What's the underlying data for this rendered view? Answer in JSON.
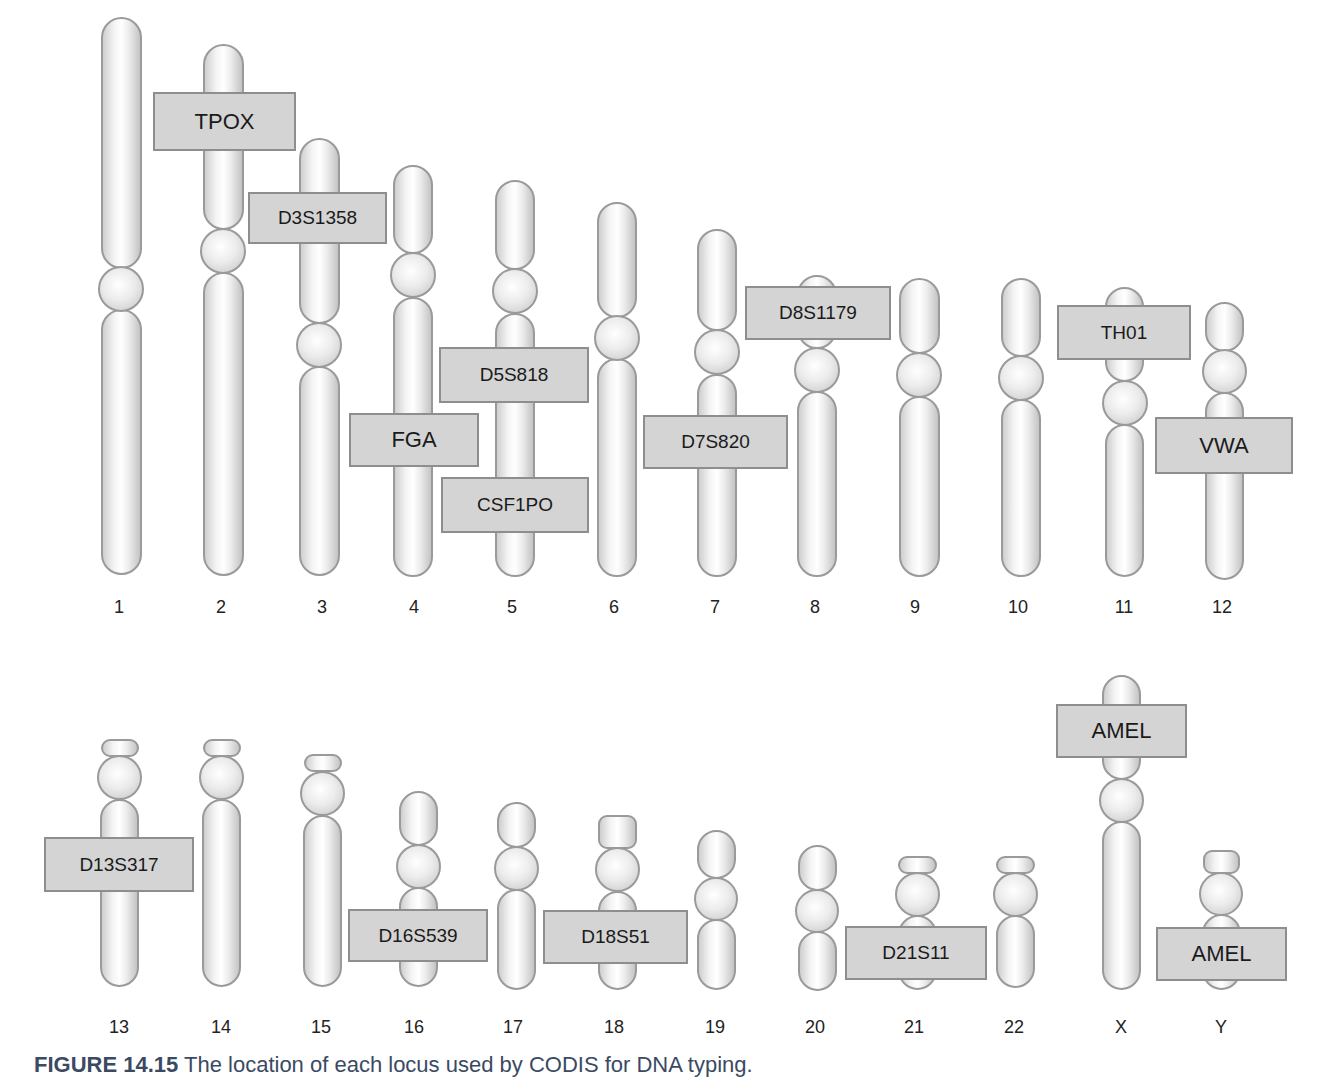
{
  "figure": {
    "caption_label": "FIGURE 14.15",
    "caption_text": "The location of each locus used by CODIS for DNA typing."
  },
  "chromosomes": [
    {
      "name": "1",
      "label_x": 119,
      "segments": [
        {
          "t": "arm",
          "x": 101,
          "y": 17,
          "w": 41,
          "h": 252
        },
        {
          "t": "circ",
          "x": 98,
          "y": 266,
          "w": 46,
          "h": 46
        },
        {
          "t": "arm",
          "x": 101,
          "y": 309,
          "w": 41,
          "h": 266
        }
      ]
    },
    {
      "name": "2",
      "label_x": 221,
      "segments": [
        {
          "t": "arm",
          "x": 203,
          "y": 44,
          "w": 41,
          "h": 186
        },
        {
          "t": "circ",
          "x": 200,
          "y": 228,
          "w": 46,
          "h": 46
        },
        {
          "t": "arm",
          "x": 203,
          "y": 272,
          "w": 41,
          "h": 304
        }
      ]
    },
    {
      "name": "3",
      "label_x": 322,
      "segments": [
        {
          "t": "arm",
          "x": 299,
          "y": 138,
          "w": 41,
          "h": 186
        },
        {
          "t": "circ",
          "x": 296,
          "y": 322,
          "w": 46,
          "h": 46
        },
        {
          "t": "arm",
          "x": 299,
          "y": 366,
          "w": 41,
          "h": 210
        }
      ]
    },
    {
      "name": "4",
      "label_x": 414,
      "segments": [
        {
          "t": "arm",
          "x": 393,
          "y": 165,
          "w": 40,
          "h": 89
        },
        {
          "t": "circ",
          "x": 390,
          "y": 252,
          "w": 46,
          "h": 46
        },
        {
          "t": "arm",
          "x": 393,
          "y": 297,
          "w": 40,
          "h": 280
        }
      ]
    },
    {
      "name": "5",
      "label_x": 512,
      "segments": [
        {
          "t": "arm",
          "x": 495,
          "y": 180,
          "w": 40,
          "h": 90
        },
        {
          "t": "circ",
          "x": 492,
          "y": 268,
          "w": 46,
          "h": 46
        },
        {
          "t": "arm",
          "x": 495,
          "y": 313,
          "w": 40,
          "h": 264
        }
      ]
    },
    {
      "name": "6",
      "label_x": 614,
      "segments": [
        {
          "t": "arm",
          "x": 597,
          "y": 202,
          "w": 40,
          "h": 116
        },
        {
          "t": "circ",
          "x": 594,
          "y": 315,
          "w": 46,
          "h": 46
        },
        {
          "t": "arm",
          "x": 597,
          "y": 358,
          "w": 40,
          "h": 219
        }
      ]
    },
    {
      "name": "7",
      "label_x": 715,
      "segments": [
        {
          "t": "arm",
          "x": 697,
          "y": 229,
          "w": 40,
          "h": 102
        },
        {
          "t": "circ",
          "x": 694,
          "y": 329,
          "w": 46,
          "h": 46
        },
        {
          "t": "arm",
          "x": 697,
          "y": 374,
          "w": 40,
          "h": 203
        }
      ]
    },
    {
      "name": "8",
      "label_x": 815,
      "segments": [
        {
          "t": "arm",
          "x": 797,
          "y": 275,
          "w": 40,
          "h": 74
        },
        {
          "t": "circ",
          "x": 794,
          "y": 347,
          "w": 46,
          "h": 46
        },
        {
          "t": "arm",
          "x": 797,
          "y": 391,
          "w": 40,
          "h": 186
        }
      ]
    },
    {
      "name": "9",
      "label_x": 915,
      "segments": [
        {
          "t": "arm",
          "x": 899,
          "y": 278,
          "w": 41,
          "h": 76
        },
        {
          "t": "circ",
          "x": 896,
          "y": 352,
          "w": 46,
          "h": 46
        },
        {
          "t": "arm",
          "x": 899,
          "y": 396,
          "w": 41,
          "h": 181
        }
      ]
    },
    {
      "name": "10",
      "label_x": 1018,
      "segments": [
        {
          "t": "arm",
          "x": 1001,
          "y": 278,
          "w": 40,
          "h": 79
        },
        {
          "t": "circ",
          "x": 998,
          "y": 355,
          "w": 46,
          "h": 46
        },
        {
          "t": "arm",
          "x": 1001,
          "y": 399,
          "w": 40,
          "h": 178
        }
      ]
    },
    {
      "name": "11",
      "label_x": 1124,
      "segments": [
        {
          "t": "arm",
          "x": 1105,
          "y": 287,
          "w": 39,
          "h": 95
        },
        {
          "t": "circ",
          "x": 1102,
          "y": 380,
          "w": 46,
          "h": 46
        },
        {
          "t": "arm",
          "x": 1105,
          "y": 424,
          "w": 39,
          "h": 153
        }
      ]
    },
    {
      "name": "12",
      "label_x": 1222,
      "segments": [
        {
          "t": "arm",
          "x": 1205,
          "y": 302,
          "w": 39,
          "h": 50
        },
        {
          "t": "circ",
          "x": 1202,
          "y": 349,
          "w": 45,
          "h": 45
        },
        {
          "t": "arm",
          "x": 1205,
          "y": 392,
          "w": 39,
          "h": 188
        }
      ]
    },
    {
      "name": "13",
      "label_x": 119,
      "segments": [
        {
          "t": "cap",
          "x": 101,
          "y": 739,
          "w": 38,
          "h": 18
        },
        {
          "t": "circ",
          "x": 97,
          "y": 755,
          "w": 45,
          "h": 45
        },
        {
          "t": "arm",
          "x": 100,
          "y": 799,
          "w": 39,
          "h": 188
        }
      ]
    },
    {
      "name": "14",
      "label_x": 221,
      "segments": [
        {
          "t": "cap",
          "x": 203,
          "y": 739,
          "w": 38,
          "h": 18
        },
        {
          "t": "circ",
          "x": 199,
          "y": 755,
          "w": 45,
          "h": 45
        },
        {
          "t": "arm",
          "x": 202,
          "y": 799,
          "w": 39,
          "h": 188
        }
      ]
    },
    {
      "name": "15",
      "label_x": 321,
      "segments": [
        {
          "t": "cap",
          "x": 304,
          "y": 754,
          "w": 38,
          "h": 18
        },
        {
          "t": "circ",
          "x": 300,
          "y": 771,
          "w": 45,
          "h": 45
        },
        {
          "t": "arm",
          "x": 303,
          "y": 815,
          "w": 39,
          "h": 172
        }
      ]
    },
    {
      "name": "16",
      "label_x": 414,
      "segments": [
        {
          "t": "arm",
          "x": 399,
          "y": 791,
          "w": 39,
          "h": 55
        },
        {
          "t": "circ",
          "x": 396,
          "y": 844,
          "w": 45,
          "h": 45
        },
        {
          "t": "arm",
          "x": 399,
          "y": 887,
          "w": 39,
          "h": 100
        }
      ]
    },
    {
      "name": "17",
      "label_x": 513,
      "segments": [
        {
          "t": "arm",
          "x": 497,
          "y": 802,
          "w": 39,
          "h": 46
        },
        {
          "t": "circ",
          "x": 494,
          "y": 846,
          "w": 45,
          "h": 45
        },
        {
          "t": "arm",
          "x": 497,
          "y": 889,
          "w": 39,
          "h": 101
        }
      ]
    },
    {
      "name": "18",
      "label_x": 614,
      "segments": [
        {
          "t": "cap",
          "x": 598,
          "y": 815,
          "w": 39,
          "h": 34
        },
        {
          "t": "circ",
          "x": 595,
          "y": 847,
          "w": 45,
          "h": 45
        },
        {
          "t": "arm",
          "x": 598,
          "y": 891,
          "w": 39,
          "h": 99
        }
      ]
    },
    {
      "name": "19",
      "label_x": 715,
      "segments": [
        {
          "t": "arm",
          "x": 697,
          "y": 830,
          "w": 39,
          "h": 49
        },
        {
          "t": "circ",
          "x": 694,
          "y": 877,
          "w": 44,
          "h": 44
        },
        {
          "t": "arm",
          "x": 697,
          "y": 919,
          "w": 39,
          "h": 71
        }
      ]
    },
    {
      "name": "20",
      "label_x": 815,
      "segments": [
        {
          "t": "arm",
          "x": 798,
          "y": 845,
          "w": 39,
          "h": 46
        },
        {
          "t": "circ",
          "x": 795,
          "y": 889,
          "w": 44,
          "h": 44
        },
        {
          "t": "arm",
          "x": 798,
          "y": 931,
          "w": 39,
          "h": 60
        }
      ]
    },
    {
      "name": "21",
      "label_x": 914,
      "segments": [
        {
          "t": "cap",
          "x": 898,
          "y": 856,
          "w": 39,
          "h": 18
        },
        {
          "t": "circ",
          "x": 895,
          "y": 872,
          "w": 45,
          "h": 45
        },
        {
          "t": "arm",
          "x": 898,
          "y": 915,
          "w": 39,
          "h": 75
        }
      ]
    },
    {
      "name": "22",
      "label_x": 1014,
      "segments": [
        {
          "t": "cap",
          "x": 996,
          "y": 856,
          "w": 39,
          "h": 18
        },
        {
          "t": "circ",
          "x": 993,
          "y": 872,
          "w": 45,
          "h": 45
        },
        {
          "t": "arm",
          "x": 996,
          "y": 915,
          "w": 39,
          "h": 73
        }
      ]
    },
    {
      "name": "X",
      "label_x": 1121,
      "segments": [
        {
          "t": "arm",
          "x": 1102,
          "y": 675,
          "w": 39,
          "h": 105
        },
        {
          "t": "circ",
          "x": 1099,
          "y": 778,
          "w": 45,
          "h": 45
        },
        {
          "t": "arm",
          "x": 1102,
          "y": 821,
          "w": 39,
          "h": 169
        }
      ]
    },
    {
      "name": "Y",
      "label_x": 1221,
      "segments": [
        {
          "t": "cap",
          "x": 1203,
          "y": 850,
          "w": 37,
          "h": 24
        },
        {
          "t": "circ",
          "x": 1199,
          "y": 872,
          "w": 44,
          "h": 44
        },
        {
          "t": "arm",
          "x": 1202,
          "y": 914,
          "w": 39,
          "h": 76
        }
      ]
    }
  ],
  "row_label_y": [
    597,
    1017
  ],
  "loci": [
    {
      "name": "TPOX",
      "chromosome": "2",
      "x": 153,
      "y": 92,
      "w": 143,
      "h": 59,
      "big": true
    },
    {
      "name": "D3S1358",
      "chromosome": "3",
      "x": 248,
      "y": 192,
      "w": 139,
      "h": 52,
      "big": false
    },
    {
      "name": "D5S818",
      "chromosome": "5",
      "x": 439,
      "y": 347,
      "w": 150,
      "h": 56,
      "big": false
    },
    {
      "name": "FGA",
      "chromosome": "4",
      "x": 349,
      "y": 413,
      "w": 130,
      "h": 54,
      "big": true
    },
    {
      "name": "CSF1PO",
      "chromosome": "5",
      "x": 441,
      "y": 477,
      "w": 148,
      "h": 56,
      "big": false
    },
    {
      "name": "D7S820",
      "chromosome": "7",
      "x": 643,
      "y": 415,
      "w": 145,
      "h": 54,
      "big": false
    },
    {
      "name": "D8S1179",
      "chromosome": "8",
      "x": 745,
      "y": 286,
      "w": 146,
      "h": 54,
      "big": false
    },
    {
      "name": "TH01",
      "chromosome": "11",
      "x": 1057,
      "y": 305,
      "w": 134,
      "h": 55,
      "big": false
    },
    {
      "name": "VWA",
      "chromosome": "12",
      "x": 1155,
      "y": 417,
      "w": 138,
      "h": 57,
      "big": true
    },
    {
      "name": "D13S317",
      "chromosome": "13",
      "x": 44,
      "y": 837,
      "w": 150,
      "h": 55,
      "big": false
    },
    {
      "name": "D16S539",
      "chromosome": "16",
      "x": 348,
      "y": 909,
      "w": 140,
      "h": 53,
      "big": false
    },
    {
      "name": "D18S51",
      "chromosome": "18",
      "x": 543,
      "y": 910,
      "w": 145,
      "h": 54,
      "big": false
    },
    {
      "name": "D21S11",
      "chromosome": "21",
      "x": 845,
      "y": 926,
      "w": 142,
      "h": 54,
      "big": false
    },
    {
      "name": "AMEL",
      "chromosome": "X",
      "x": 1056,
      "y": 704,
      "w": 131,
      "h": 54,
      "big": true
    },
    {
      "name": "AMEL",
      "chromosome": "Y",
      "x": 1156,
      "y": 927,
      "w": 131,
      "h": 54,
      "big": true
    }
  ],
  "colors": {
    "locus_fill": "#d4d4d4",
    "locus_border": "#8e8e8e",
    "chromosome_outline": "#9a9a9a",
    "caption": "#3b4a63"
  }
}
